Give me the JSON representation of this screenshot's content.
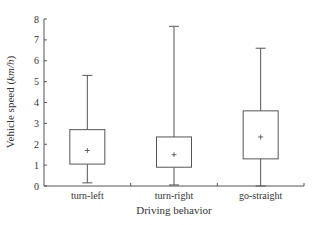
{
  "chart_data": {
    "type": "box",
    "title": "",
    "xlabel": "Driving behavior",
    "ylabel": "Vehicle speed (km/h)",
    "ylabel_main": "Vehicle speed (",
    "ylabel_unit": "km/h",
    "ylabel_close": ")",
    "ylim": [
      0,
      8
    ],
    "yticks": [
      0,
      1,
      2,
      3,
      4,
      5,
      6,
      7,
      8
    ],
    "grid": false,
    "legend": "none",
    "categories": [
      "turn-left",
      "turn-right",
      "go-straight"
    ],
    "series": [
      {
        "name": "turn-left",
        "min": 0.15,
        "q1": 1.05,
        "q3": 2.7,
        "max": 5.3,
        "mean": 1.7
      },
      {
        "name": "turn-right",
        "min": 0.05,
        "q1": 0.9,
        "q3": 2.35,
        "max": 7.65,
        "mean": 1.5
      },
      {
        "name": "go-straight",
        "min": 0.0,
        "q1": 1.3,
        "q3": 3.6,
        "max": 6.6,
        "mean": 2.35
      }
    ],
    "colors": {
      "line": "#555555",
      "text": "#333333"
    }
  }
}
